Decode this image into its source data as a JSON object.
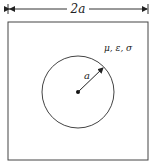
{
  "diagram": {
    "dimension_label": "2a",
    "radius_label": "a",
    "material_label": "μ, ε, σ",
    "colors": {
      "stroke": "#333333",
      "background": "#ffffff"
    }
  }
}
